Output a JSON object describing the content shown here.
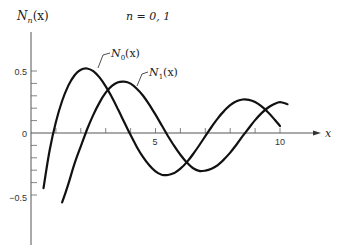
{
  "chart_data": {
    "type": "line",
    "title": "n = 0, 1",
    "xlabel": "x",
    "ylabel": "N_n(x)",
    "xlim": [
      0,
      11.5
    ],
    "ylim": [
      -0.8,
      0.85
    ],
    "grid": false,
    "x_ticks": [
      1,
      2,
      3,
      4,
      5,
      6,
      7,
      8,
      9,
      10
    ],
    "x_tick_labels": [
      {
        "value": 5,
        "label": "5"
      },
      {
        "value": 10,
        "label": "10"
      }
    ],
    "y_ticks": [
      -0.5,
      -0.4,
      -0.3,
      -0.2,
      -0.1,
      0,
      0.1,
      0.2,
      0.3,
      0.4,
      0.5
    ],
    "y_tick_labels": [
      {
        "value": 0.5,
        "label": "0.5"
      },
      {
        "value": 0,
        "label": "0"
      },
      {
        "value": -0.5,
        "label": "-0.5"
      }
    ],
    "series": [
      {
        "name": "N0(x)",
        "label_main": "N",
        "label_sub": "0",
        "label_tail": "(x)",
        "x": [
          0.5,
          0.75,
          1,
          1.25,
          1.5,
          1.75,
          2,
          2.25,
          2.5,
          2.75,
          3,
          3.25,
          3.5,
          3.75,
          4,
          4.25,
          4.5,
          4.75,
          5,
          5.25,
          5.5,
          5.75,
          6,
          6.25,
          6.5,
          6.75,
          7,
          7.25,
          7.5,
          7.75,
          8,
          8.25,
          8.5,
          8.75,
          9,
          9.25,
          9.5,
          9.75,
          10
        ],
        "values": [
          -0.445,
          -0.137,
          0.088,
          0.258,
          0.382,
          0.466,
          0.51,
          0.52,
          0.498,
          0.448,
          0.377,
          0.289,
          0.189,
          0.085,
          -0.017,
          -0.112,
          -0.195,
          -0.26,
          -0.309,
          -0.336,
          -0.339,
          -0.323,
          -0.288,
          -0.237,
          -0.173,
          -0.101,
          -0.026,
          0.048,
          0.118,
          0.177,
          0.224,
          0.256,
          0.27,
          0.268,
          0.25,
          0.217,
          0.171,
          0.116,
          0.056
        ]
      },
      {
        "name": "N1(x)",
        "label_main": "N",
        "label_sub": "1",
        "label_tail": "(x)",
        "x": [
          1.25,
          1.5,
          1.75,
          2,
          2.25,
          2.5,
          2.75,
          3,
          3.25,
          3.5,
          3.75,
          4,
          4.25,
          4.5,
          4.75,
          5,
          5.25,
          5.5,
          5.75,
          6,
          6.25,
          6.5,
          6.75,
          7,
          7.25,
          7.5,
          7.75,
          8,
          8.25,
          8.5,
          8.75,
          9,
          9.25,
          9.5,
          9.75,
          10,
          10.3
        ],
        "values": [
          -0.56,
          -0.412,
          -0.245,
          -0.107,
          0.028,
          0.146,
          0.245,
          0.325,
          0.38,
          0.41,
          0.414,
          0.398,
          0.357,
          0.301,
          0.229,
          0.148,
          0.062,
          -0.024,
          -0.104,
          -0.175,
          -0.236,
          -0.282,
          -0.306,
          -0.303,
          -0.288,
          -0.259,
          -0.213,
          -0.158,
          -0.094,
          -0.026,
          0.04,
          0.104,
          0.158,
          0.202,
          0.232,
          0.249,
          0.232
        ]
      }
    ],
    "annotations": [
      {
        "text": "n = 0,1",
        "position": "top-center"
      }
    ]
  },
  "labels": {
    "ylabel_main": "N",
    "ylabel_sub": "n",
    "ylabel_tail": "(x)",
    "xlabel": "x",
    "title": "n = 0, 1",
    "n0_main": "N",
    "n0_sub": "0",
    "n0_tail": "(x)",
    "n1_main": "N",
    "n1_sub": "1",
    "n1_tail": "(x)",
    "tick_pos_half": "0.5",
    "tick_zero": "0",
    "tick_neg_half": "−0.5",
    "tick_5": "5",
    "tick_10": "10"
  },
  "colors": {
    "curve": "#111111",
    "axis": "#555555",
    "text": "#222222"
  }
}
